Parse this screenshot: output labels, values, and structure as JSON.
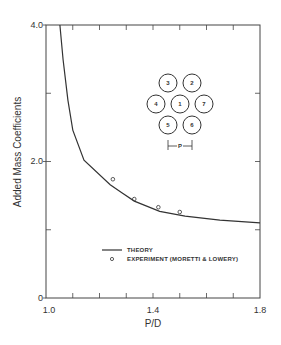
{
  "chart_data": {
    "type": "line",
    "title": "",
    "xlabel": "P/D",
    "ylabel": "Added Mass Coefficients",
    "xlim": [
      1.0,
      1.8
    ],
    "ylim": [
      0,
      4.0
    ],
    "x_tick_labels": [
      "1.0",
      "1.4",
      "1.8"
    ],
    "x_ticks": [
      1.0,
      1.1,
      1.2,
      1.3,
      1.4,
      1.5,
      1.6,
      1.7,
      1.8
    ],
    "y_tick_labels": [
      "0",
      "2.0",
      "4.0"
    ],
    "y_ticks": [
      0,
      1.0,
      2.0,
      3.0,
      4.0
    ],
    "grid": false,
    "legend_position": "lower center",
    "series": [
      {
        "name": "THEORY",
        "style": "line",
        "x": [
          1.052,
          1.064,
          1.082,
          1.1,
          1.142,
          1.24,
          1.285,
          1.33,
          1.425,
          1.52,
          1.65,
          1.8
        ],
        "y": [
          4.0,
          3.49,
          2.9,
          2.46,
          2.02,
          1.66,
          1.54,
          1.42,
          1.27,
          1.2,
          1.14,
          1.1
        ]
      },
      {
        "name": "EXPERIMENT (MORETTI & LOWERY)",
        "style": "open-circle-markers",
        "x": [
          1.25,
          1.33,
          1.42,
          1.5
        ],
        "y": [
          1.74,
          1.45,
          1.33,
          1.26
        ]
      }
    ],
    "annotations": {
      "inset": "seven-rod hexagonal cluster diagram",
      "rod_labels": [
        "3",
        "2",
        "4",
        "1",
        "7",
        "5",
        "6"
      ],
      "pitch_label": "P"
    }
  },
  "axes": {
    "xlabel": "P/D",
    "ylabel": "Added Mass Coefficients",
    "x_tick_labels": [
      "1.0",
      "1.4",
      "1.8"
    ],
    "y_tick_labels": [
      "0",
      "2.0",
      "4.0"
    ]
  },
  "legend": {
    "theory": "THEORY",
    "experiment": "EXPERIMENT (MORETTI & LOWERY)"
  },
  "inset": {
    "rods": [
      {
        "label": "3",
        "cx": 168,
        "cy": 83
      },
      {
        "label": "2",
        "cx": 192,
        "cy": 83
      },
      {
        "label": "4",
        "cx": 156,
        "cy": 104
      },
      {
        "label": "1",
        "cx": 180,
        "cy": 104
      },
      {
        "label": "7",
        "cx": 204,
        "cy": 104
      },
      {
        "label": "5",
        "cx": 168,
        "cy": 125
      },
      {
        "label": "6",
        "cx": 192,
        "cy": 125
      }
    ],
    "pitch_label": "P"
  },
  "colors": {
    "ink": "#333333",
    "background": "#ffffff"
  }
}
